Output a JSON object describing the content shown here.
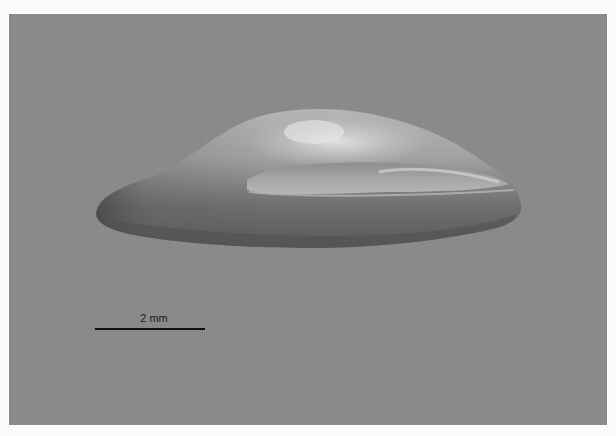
{
  "image": {
    "subject": "seed specimen photographed against gray background",
    "background_color": "#8a8a8a",
    "border_color": "#fbfbfb"
  },
  "scalebar": {
    "label": "2 mm"
  }
}
